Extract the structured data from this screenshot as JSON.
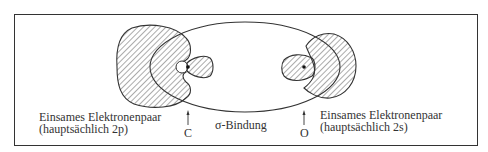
{
  "figure": {
    "atoms": [
      {
        "symbol": "C",
        "position": "left"
      },
      {
        "symbol": "O",
        "position": "right"
      }
    ],
    "labels": {
      "left_lone_pair_line1": "Einsames Elektronenpaar",
      "left_lone_pair_line2": "(hauptsächlich 2p)",
      "right_lone_pair_line1": "Einsames Elektronenpaar",
      "right_lone_pair_line2": "(hauptsächlich 2s)",
      "bond": "σ-Bindung",
      "carbon": "C",
      "oxygen": "O"
    },
    "colors": {
      "line": "#333333",
      "hatch": "#444444",
      "background": "#ffffff"
    }
  }
}
